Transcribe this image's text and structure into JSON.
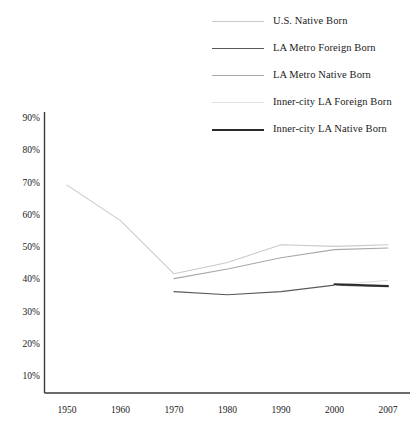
{
  "chart_data": {
    "type": "line",
    "title": "",
    "xlabel": "",
    "ylabel": "",
    "categories": [
      "1950",
      "1960",
      "1970",
      "1980",
      "1990",
      "2000",
      "2007"
    ],
    "ylim": [
      0,
      90
    ],
    "ytick_labels": [
      "10%",
      "20%",
      "30%",
      "40%",
      "50%",
      "60%",
      "70%",
      "80%",
      "90%"
    ],
    "ytick_values": [
      10,
      20,
      30,
      40,
      50,
      60,
      70,
      80,
      90
    ],
    "grid": false,
    "legend_position": "top-right",
    "series": [
      {
        "name": "U.S. Native Born",
        "color": "#c9c9c9",
        "width": 1.1,
        "values": [
          69.5,
          58.5,
          42.0,
          45.5,
          51.0,
          50.5,
          51.0
        ]
      },
      {
        "name": "LA Metro Foreign Born",
        "color": "#5a5a5a",
        "width": 1.2,
        "values": [
          null,
          null,
          36.5,
          35.5,
          36.5,
          38.5,
          38.0
        ]
      },
      {
        "name": "LA Metro Native Born",
        "color": "#a8a8a8",
        "width": 1.1,
        "values": [
          null,
          null,
          40.5,
          43.5,
          47.0,
          49.5,
          50.0
        ]
      },
      {
        "name": "Inner-city LA Foreign Born",
        "color": "#e0e0e0",
        "width": 1.1,
        "values": [
          null,
          null,
          null,
          null,
          null,
          38.5,
          40.0
        ]
      },
      {
        "name": "Inner-city LA Native Born",
        "color": "#2b2b2b",
        "width": 1.9,
        "values": [
          null,
          null,
          null,
          null,
          null,
          38.8,
          38.2
        ]
      }
    ]
  },
  "legend": {
    "items": [
      {
        "label": "U.S. Native Born"
      },
      {
        "label": "LA Metro Foreign Born"
      },
      {
        "label": "LA Metro Native Born"
      },
      {
        "label": "Inner-city LA Foreign Born"
      },
      {
        "label": "Inner-city LA Native Born"
      }
    ]
  },
  "axes": {
    "axis_color": "#3a3a3a"
  }
}
